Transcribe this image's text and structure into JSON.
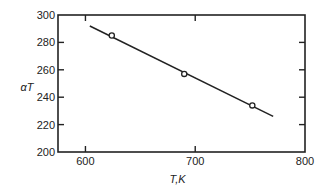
{
  "chart_data": {
    "type": "line",
    "title": "",
    "xlabel": "T,K",
    "ylabel": "αT",
    "xlim": [
      575,
      800
    ],
    "ylim": [
      200,
      300
    ],
    "xticks": [
      600,
      700,
      800
    ],
    "yticks": [
      200,
      220,
      240,
      260,
      280,
      300
    ],
    "grid": false,
    "legend": "none",
    "series": [
      {
        "name": "fit",
        "style": "line",
        "x": [
          604,
          771
        ],
        "y": [
          292,
          226
        ]
      },
      {
        "name": "measured",
        "style": "open-circle",
        "x": [
          624,
          690,
          752
        ],
        "y": [
          285,
          257,
          234
        ]
      }
    ],
    "colors": {
      "ink": "#222222",
      "background": "#ffffff"
    }
  }
}
